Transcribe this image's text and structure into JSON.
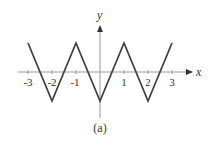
{
  "chart_data": {
    "type": "line",
    "title": "",
    "caption": "(a)",
    "xlabel": "x",
    "ylabel": "y",
    "x_ticks": [
      "-3",
      "-2",
      "-1",
      "1",
      "2",
      "3"
    ],
    "xlim": [
      -3,
      3
    ],
    "ylim": [
      -1,
      1
    ],
    "grid": false,
    "legend": null,
    "series": [
      {
        "name": "triangle wave",
        "x": [
          -3,
          -2,
          -1,
          0,
          1,
          2,
          3
        ],
        "y": [
          1,
          -1,
          1,
          -1,
          1,
          -1,
          1
        ]
      }
    ],
    "line_color": "#444444",
    "axis_color": "#888888"
  }
}
